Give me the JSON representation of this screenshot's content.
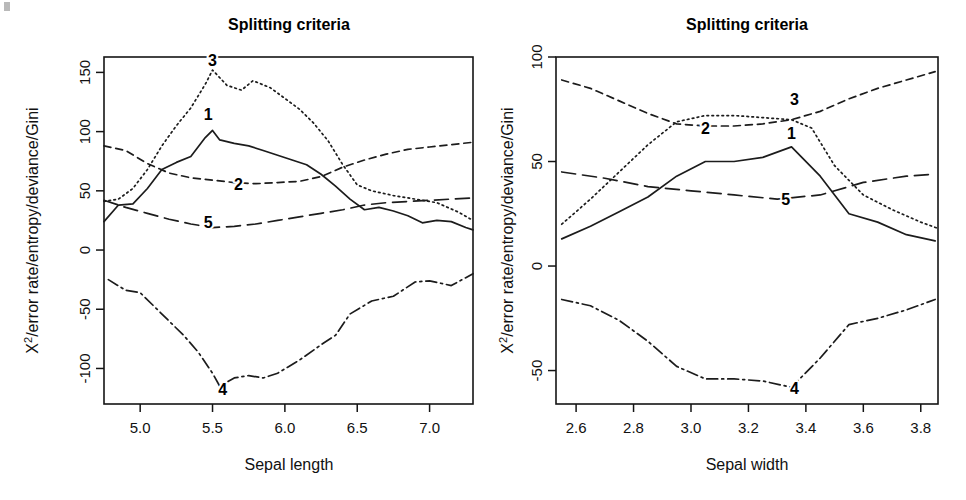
{
  "figure": {
    "width": 966,
    "height": 500,
    "background": "#ffffff",
    "ink_color": "#1c1c1c"
  },
  "chart_data": [
    {
      "type": "line",
      "panel": "left",
      "title": "Splitting criteria",
      "xlabel": "Sepal length",
      "ylabel": "X2/error rate/entropy/deviance/Gini",
      "ylabel_display": "X²/error rate/entropy/deviance/Gini",
      "xlim": [
        4.75,
        7.3
      ],
      "ylim": [
        -130,
        163
      ],
      "grid": false,
      "legend": "inline-numbered-labels",
      "xticks": [
        5.0,
        5.5,
        6.0,
        6.5,
        7.0
      ],
      "xticklabels": [
        "5.0",
        "5.5",
        "6.0",
        "6.5",
        "7.0"
      ],
      "yticks": [
        -100,
        -50,
        0,
        50,
        100,
        150
      ],
      "yticklabels": [
        "-100",
        "-50",
        "0",
        "50",
        "100",
        "150"
      ],
      "series": [
        {
          "name": "1",
          "label": "1",
          "linestyle": "solid",
          "dash": "none",
          "label_x": 5.47,
          "label_y": 110,
          "x": [
            4.75,
            4.85,
            4.95,
            5.05,
            5.15,
            5.25,
            5.35,
            5.45,
            5.5,
            5.55,
            5.65,
            5.75,
            5.85,
            5.95,
            6.05,
            6.15,
            6.25,
            6.35,
            6.45,
            6.55,
            6.65,
            6.75,
            6.85,
            6.95,
            7.05,
            7.15,
            7.25,
            7.3
          ],
          "y": [
            24,
            38,
            39,
            52,
            68,
            74,
            79,
            95,
            101,
            93,
            90,
            88,
            84,
            80,
            76,
            72,
            64,
            54,
            43,
            34,
            36,
            33,
            29,
            23,
            25,
            24,
            19,
            17
          ]
        },
        {
          "name": "2",
          "label": "2",
          "linestyle": "dashed",
          "dash": "7,5",
          "label_x": 5.68,
          "label_y": 51,
          "x": [
            4.75,
            4.9,
            5.05,
            5.2,
            5.35,
            5.5,
            5.65,
            5.8,
            5.95,
            6.1,
            6.25,
            6.4,
            6.55,
            6.7,
            6.85,
            7.0,
            7.15,
            7.3
          ],
          "y": [
            88,
            84,
            73,
            65,
            61,
            59,
            57,
            56,
            57,
            58,
            62,
            70,
            76,
            81,
            85,
            87,
            89,
            91
          ]
        },
        {
          "name": "3",
          "label": "3",
          "linestyle": "dotted",
          "dash": "1.6,3.4",
          "label_x": 5.5,
          "label_y": 155,
          "x": [
            4.75,
            4.85,
            4.95,
            5.05,
            5.15,
            5.25,
            5.35,
            5.45,
            5.5,
            5.6,
            5.7,
            5.78,
            5.9,
            6.0,
            6.1,
            6.2,
            6.3,
            6.4,
            6.5,
            6.6,
            6.75,
            6.9,
            7.05,
            7.2,
            7.3
          ],
          "y": [
            41,
            43,
            52,
            68,
            88,
            105,
            120,
            140,
            152,
            139,
            135,
            143,
            137,
            128,
            119,
            107,
            92,
            72,
            55,
            50,
            46,
            43,
            40,
            32,
            25
          ]
        },
        {
          "name": "4",
          "label": "4",
          "linestyle": "dashdot",
          "dash": "11,4,2,4",
          "label_x": 5.57,
          "label_y": -122,
          "x": [
            4.78,
            4.9,
            5.0,
            5.1,
            5.2,
            5.3,
            5.4,
            5.5,
            5.55,
            5.65,
            5.75,
            5.85,
            5.95,
            6.1,
            6.25,
            6.35,
            6.45,
            6.6,
            6.75,
            6.9,
            7.0,
            7.15,
            7.3
          ],
          "y": [
            -25,
            -34,
            -36,
            -48,
            -60,
            -72,
            -86,
            -104,
            -115,
            -108,
            -106,
            -108,
            -104,
            -93,
            -80,
            -72,
            -54,
            -43,
            -39,
            -27,
            -26,
            -30,
            -20
          ]
        },
        {
          "name": "5",
          "label": "5",
          "linestyle": "longdash",
          "dash": "14,7",
          "label_x": 5.47,
          "label_y": 19,
          "x": [
            4.75,
            4.9,
            5.05,
            5.2,
            5.35,
            5.5,
            5.65,
            5.8,
            5.95,
            6.1,
            6.25,
            6.4,
            6.55,
            6.7,
            6.85,
            7.0,
            7.15,
            7.3
          ],
          "y": [
            42,
            36,
            31,
            26,
            22,
            19,
            20,
            22,
            25,
            28,
            31,
            34,
            38,
            40,
            41,
            42,
            43,
            44
          ]
        }
      ]
    },
    {
      "type": "line",
      "panel": "right",
      "title": "Splitting criteria",
      "xlabel": "Sepal width",
      "ylabel": "X2/error rate/entropy/deviance/Gini",
      "ylabel_display": "X²/error rate/entropy/deviance/Gini",
      "xlim": [
        2.53,
        3.86
      ],
      "ylim": [
        -66,
        100
      ],
      "grid": false,
      "legend": "inline-numbered-labels",
      "xticks": [
        2.6,
        2.8,
        3.0,
        3.2,
        3.4,
        3.6,
        3.8
      ],
      "xticklabels": [
        "2.6",
        "2.8",
        "3.0",
        "3.2",
        "3.4",
        "3.6",
        "3.8"
      ],
      "yticks": [
        -50,
        0,
        50,
        100
      ],
      "yticklabels": [
        "-50",
        "0",
        "50",
        "100"
      ],
      "series": [
        {
          "name": "1",
          "label": "1",
          "linestyle": "solid",
          "dash": "none",
          "label_x": 3.35,
          "label_y": 61,
          "x": [
            2.55,
            2.65,
            2.75,
            2.85,
            2.95,
            3.05,
            3.15,
            3.25,
            3.35,
            3.45,
            3.55,
            3.65,
            3.75,
            3.85
          ],
          "y": [
            13,
            19,
            26,
            33,
            43,
            50,
            50,
            52,
            57,
            43,
            25,
            21,
            15,
            12
          ]
        },
        {
          "name": "2",
          "label": "2",
          "linestyle": "dashed",
          "dash": "7,5",
          "label_x": 3.05,
          "label_y": 63,
          "x": [
            2.55,
            2.65,
            2.75,
            2.85,
            2.95,
            3.05,
            3.15,
            3.25,
            3.35,
            3.45,
            3.55,
            3.65,
            3.75,
            3.85
          ],
          "y": [
            89,
            85,
            79,
            73,
            68,
            67,
            67,
            68,
            70,
            74,
            80,
            85,
            89,
            93
          ]
        },
        {
          "name": "3",
          "label": "3",
          "linestyle": "dotted",
          "dash": "1.6,3.4",
          "label_x": 3.36,
          "label_y": 77,
          "x": [
            2.55,
            2.65,
            2.75,
            2.85,
            2.95,
            3.05,
            3.15,
            3.25,
            3.35,
            3.42,
            3.5,
            3.6,
            3.7,
            3.8,
            3.86
          ],
          "y": [
            20,
            32,
            45,
            58,
            69,
            72,
            72,
            71,
            70,
            66,
            48,
            34,
            27,
            21,
            18
          ]
        },
        {
          "name": "4",
          "label": "4",
          "linestyle": "dashdot",
          "dash": "11,4,2,4",
          "label_x": 3.36,
          "label_y": -61,
          "x": [
            2.55,
            2.65,
            2.75,
            2.85,
            2.95,
            3.05,
            3.15,
            3.25,
            3.35,
            3.45,
            3.55,
            3.65,
            3.75,
            3.85
          ],
          "y": [
            -16,
            -19,
            -26,
            -36,
            -48,
            -54,
            -54,
            -55,
            -58,
            -44,
            -28,
            -25,
            -21,
            -16
          ]
        },
        {
          "name": "5",
          "label": "5",
          "linestyle": "longdash",
          "dash": "14,7",
          "label_x": 3.33,
          "label_y": 29,
          "x": [
            2.55,
            2.7,
            2.85,
            3.0,
            3.15,
            3.3,
            3.45,
            3.6,
            3.75,
            3.85
          ],
          "y": [
            45,
            42,
            38,
            36,
            34,
            32,
            34,
            40,
            43,
            44
          ]
        }
      ]
    }
  ]
}
